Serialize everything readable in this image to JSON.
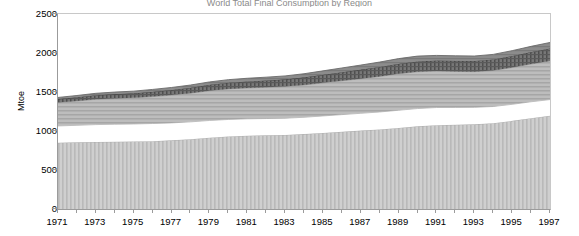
{
  "title_sliver": "World Total Final Consumption by Region",
  "axes": {
    "ylabel": "Mtoe",
    "yticks": [
      0,
      500,
      1000,
      1500,
      2000,
      2500
    ],
    "ylim": [
      0,
      2500
    ],
    "xlabels": [
      "1971",
      "1973",
      "1975",
      "1977",
      "1979",
      "1981",
      "1983",
      "1985",
      "1987",
      "1989",
      "1991",
      "1993",
      "1995",
      "1997"
    ],
    "xlim": [
      1971,
      1997
    ]
  },
  "colors": {
    "band1": "#c9c9c9",
    "band2": "#ffffff",
    "band3": "#b4b4b4",
    "band4": "#6e6e6e",
    "band5": "#8a8a8a",
    "axis": "#9b9b9b",
    "gridline": "#c8c8c8"
  },
  "chart_data": {
    "type": "area",
    "title": "World Total Final Consumption by Region",
    "xlabel": "",
    "ylabel": "Mtoe",
    "ylim": [
      0,
      2500
    ],
    "grid": false,
    "legend": "none",
    "stacked": true,
    "x": [
      1971,
      1972,
      1973,
      1974,
      1975,
      1976,
      1977,
      1978,
      1979,
      1980,
      1981,
      1982,
      1983,
      1984,
      1985,
      1986,
      1987,
      1988,
      1989,
      1990,
      1991,
      1992,
      1993,
      1994,
      1995,
      1996,
      1997
    ],
    "series": [
      {
        "name": "Band 1 (bottom, vertical hatch)",
        "values": [
          850,
          855,
          860,
          862,
          865,
          870,
          880,
          895,
          915,
          930,
          940,
          945,
          950,
          960,
          975,
          990,
          1005,
          1020,
          1040,
          1060,
          1075,
          1080,
          1085,
          1100,
          1130,
          1165,
          1195
        ]
      },
      {
        "name": "Band 2 (white)",
        "values": [
          215,
          218,
          222,
          225,
          225,
          226,
          224,
          222,
          220,
          218,
          216,
          215,
          214,
          216,
          218,
          220,
          222,
          224,
          226,
          228,
          226,
          222,
          218,
          214,
          212,
          210,
          208
        ]
      },
      {
        "name": "Band 3 (mid grey, horizontal hatch)",
        "values": [
          300,
          312,
          325,
          330,
          335,
          345,
          356,
          368,
          382,
          392,
          396,
          400,
          406,
          414,
          424,
          434,
          444,
          456,
          468,
          472,
          468,
          462,
          458,
          462,
          472,
          484,
          496
        ]
      },
      {
        "name": "Band 4 (dark cross-hatch)",
        "values": [
          45,
          48,
          52,
          56,
          58,
          62,
          66,
          70,
          76,
          80,
          84,
          88,
          92,
          98,
          104,
          110,
          116,
          122,
          128,
          132,
          134,
          136,
          138,
          142,
          148,
          154,
          160
        ]
      },
      {
        "name": "Band 5 (top, grey)",
        "values": [
          20,
          22,
          24,
          26,
          28,
          30,
          32,
          34,
          36,
          38,
          40,
          42,
          44,
          46,
          50,
          54,
          58,
          62,
          66,
          68,
          66,
          64,
          62,
          64,
          68,
          72,
          76
        ]
      }
    ],
    "stack_totals": [
      1430,
      1455,
      1483,
      1499,
      1511,
      1533,
      1558,
      1589,
      1629,
      1658,
      1676,
      1690,
      1706,
      1734,
      1771,
      1808,
      1845,
      1884,
      1928,
      1960,
      1969,
      1964,
      1961,
      1982,
      2030,
      2085,
      2135
    ]
  }
}
